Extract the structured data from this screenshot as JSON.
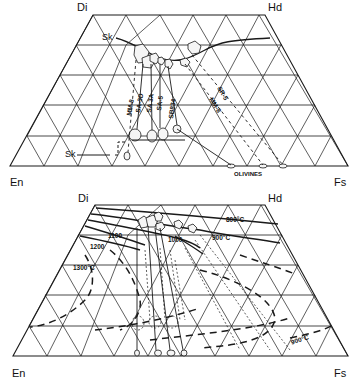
{
  "top_diagram": {
    "corners": {
      "top_left": "Di",
      "top_right": "Hd",
      "bottom_left": "En",
      "bottom_right": "Fs"
    },
    "labels": {
      "sk_upper": "Sk",
      "sk_lower": "Sk",
      "olivines": "OLIVINES"
    },
    "sample_labels": [
      "MM-8",
      "SA-3D",
      "SA 3A",
      "SA-5",
      "SB834"
    ],
    "right_labels": [
      "SR-5",
      "MM-8"
    ]
  },
  "bottom_diagram": {
    "corners": {
      "top_left": "Di",
      "top_right": "Hd",
      "bottom_left": "En",
      "bottom_right": "Fs"
    },
    "isotherms": {
      "t800": "800°C",
      "t900": "900°C",
      "t1000": "1000",
      "t1100": "1100",
      "t1200": "1200",
      "t1300": "1300°C",
      "t900_low": "900°C"
    }
  },
  "colors": {
    "ink": "#1a1a1a",
    "background": "#ffffff"
  }
}
